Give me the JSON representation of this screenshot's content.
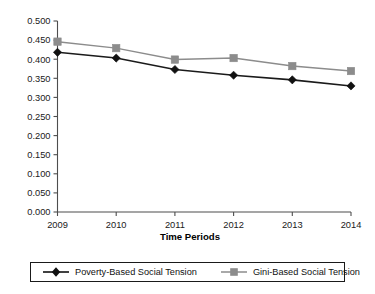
{
  "chart_data": {
    "type": "line",
    "title": "",
    "xlabel": "Time Periods",
    "ylabel": "",
    "categories": [
      "2009",
      "2010",
      "2011",
      "2012",
      "2013",
      "2014"
    ],
    "series": [
      {
        "name": "Poverty-Based Social Tension",
        "color": "#111111",
        "marker": "diamond",
        "values": [
          0.418,
          0.403,
          0.373,
          0.358,
          0.346,
          0.33
        ]
      },
      {
        "name": "Gini-Based Social Tension",
        "color": "#8c8c8c",
        "marker": "square",
        "values": [
          0.446,
          0.429,
          0.399,
          0.403,
          0.382,
          0.369
        ]
      }
    ],
    "ylim": [
      0.0,
      0.5
    ],
    "ytick_labels": [
      "0.000",
      "0.050",
      "0.100",
      "0.150",
      "0.200",
      "0.250",
      "0.300",
      "0.350",
      "0.400",
      "0.450",
      "0.500"
    ],
    "ytick_values": [
      0.0,
      0.05,
      0.1,
      0.15,
      0.2,
      0.25,
      0.3,
      0.35,
      0.4,
      0.45,
      0.5
    ],
    "grid": false,
    "legend_position": "bottom"
  },
  "legend": {
    "entries": [
      {
        "label": "Poverty-Based Social Tension"
      },
      {
        "label": "Gini-Based Social Tension"
      }
    ]
  }
}
